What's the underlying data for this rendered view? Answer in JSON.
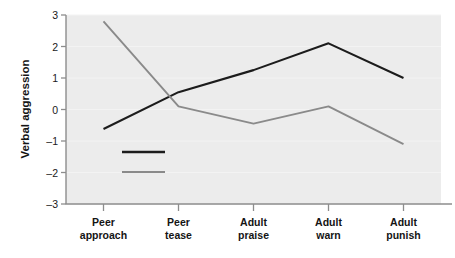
{
  "chart_data": {
    "type": "line",
    "title": "",
    "xlabel": "",
    "ylabel": "Verbal aggression",
    "categories": [
      "Peer approach",
      "Peer tease",
      "Adult praise",
      "Adult warn",
      "Adult punish"
    ],
    "category_lines": [
      [
        "Peer",
        "approach"
      ],
      [
        "Peer",
        "tease"
      ],
      [
        "Adult",
        "praise"
      ],
      [
        "Adult",
        "warn"
      ],
      [
        "Adult",
        "punish"
      ]
    ],
    "ylim": [
      -3,
      3
    ],
    "yticks": [
      3,
      2,
      1,
      0,
      -1,
      -2,
      -3
    ],
    "ytick_labels": [
      "3",
      "2",
      "1",
      "0",
      "–1",
      "–2",
      "–3"
    ],
    "grid": "horizontal-faint",
    "legend_position": "inside-lower-left",
    "series": [
      {
        "name": "Child A",
        "color": "#1c1c1c",
        "values": [
          -0.62,
          0.55,
          1.25,
          2.1,
          1.0
        ]
      },
      {
        "name": "Child B",
        "color": "#8a8a8a",
        "values": [
          2.8,
          0.1,
          -0.45,
          0.1,
          -1.1
        ]
      }
    ],
    "colors": {
      "plot_background": "#ececec",
      "page_background": "#ffffff",
      "axis": "#8d8d8d",
      "text": "#141414",
      "series_a": "#1c1c1c",
      "series_b": "#8a8a8a"
    }
  },
  "legend": {
    "items": [
      {
        "label": "Child A",
        "color": "#1c1c1c"
      },
      {
        "label": "Child B",
        "color": "#8a8a8a"
      }
    ]
  }
}
